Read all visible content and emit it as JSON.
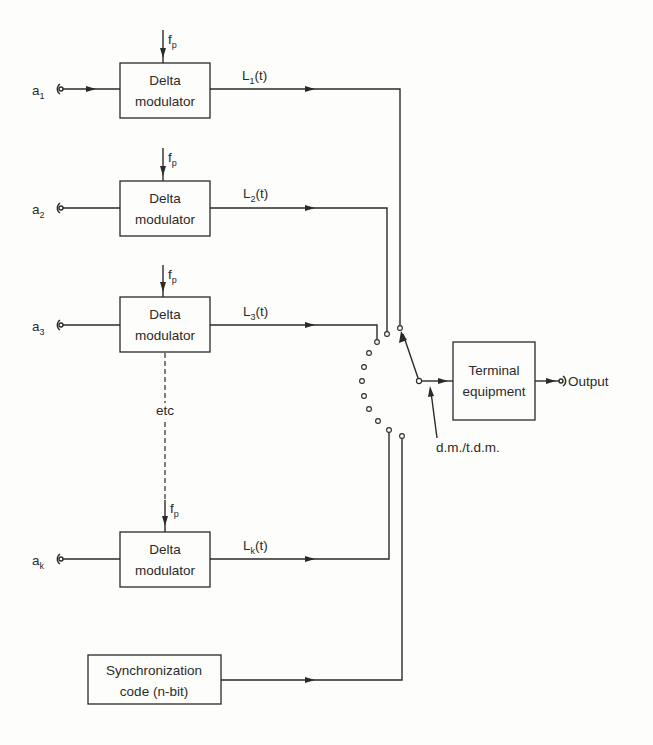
{
  "diagram": {
    "type": "block-diagram",
    "colors": {
      "ink": "#2a2a2a",
      "background": "#fdfdfb"
    },
    "clock_label": {
      "main": "f",
      "sub": "p"
    },
    "channels": [
      {
        "input_main": "a",
        "input_sub": "1",
        "block_line1": "Delta",
        "block_line2": "modulator",
        "output_main": "L",
        "output_sub": "1",
        "output_arg": "(t)"
      },
      {
        "input_main": "a",
        "input_sub": "2",
        "block_line1": "Delta",
        "block_line2": "modulator",
        "output_main": "L",
        "output_sub": "2",
        "output_arg": "(t)"
      },
      {
        "input_main": "a",
        "input_sub": "3",
        "block_line1": "Delta",
        "block_line2": "modulator",
        "output_main": "L",
        "output_sub": "3",
        "output_arg": "(t)"
      },
      {
        "input_main": "a",
        "input_sub": "k",
        "block_line1": "Delta",
        "block_line2": "modulator",
        "output_main": "L",
        "output_sub": "k",
        "output_arg": "(t)"
      }
    ],
    "continuation_label": "etc",
    "sync_block": {
      "line1": "Synchronization",
      "line2": "code (n-bit)"
    },
    "switch_label": "d.m./t.d.m.",
    "terminal_block": {
      "line1": "Terminal",
      "line2": "equipment"
    },
    "output_label": "Output"
  }
}
